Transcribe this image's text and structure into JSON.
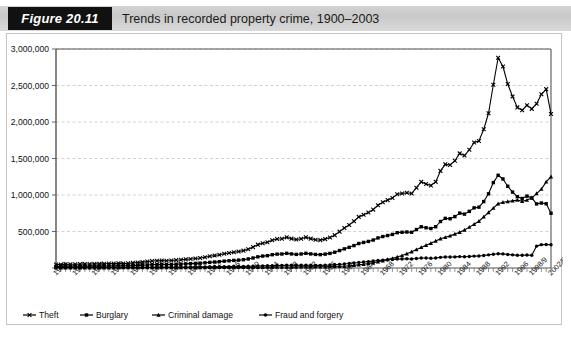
{
  "figure": {
    "tag": "Figure 20.11",
    "caption": "Trends in recorded property crime, 1900–2003"
  },
  "chart_data": {
    "type": "line",
    "title": "Trends in recorded property crime, 1900–2003",
    "xlabel": "",
    "ylabel": "",
    "ylim": [
      0,
      3000000
    ],
    "ytick_values": [
      0,
      500000,
      1000000,
      1500000,
      2000000,
      2500000,
      3000000
    ],
    "ytick_labels": [
      "",
      "500,000",
      "1,000,000",
      "1,500,000",
      "2,000,000",
      "2,500,000",
      "3,000,000"
    ],
    "grid": true,
    "grid_axis": "y",
    "legend_position": "below-axis-left",
    "x_tick_labels": [
      "1900",
      "1904",
      "1908",
      "1912",
      "1916",
      "1920",
      "1924",
      "1928",
      "1932",
      "1936",
      "1940",
      "1944",
      "1948",
      "1952",
      "1956",
      "1960",
      "1964",
      "1968",
      "1972",
      "1976",
      "1980",
      "1984",
      "1988",
      "1992",
      "1996",
      "1998/9",
      "2002/03"
    ],
    "x_tick_label_rotation": 45,
    "x_label_interval_years": 4,
    "x_start_year": 1900,
    "x_end_year": 2003,
    "x_points_count": 104,
    "series": [
      {
        "name": "Theft",
        "marker": "x",
        "color": "#000000",
        "values": [
          48000,
          49000,
          50000,
          51000,
          52000,
          53000,
          54000,
          55000,
          56000,
          57000,
          58000,
          60000,
          62000,
          64000,
          62000,
          64000,
          70000,
          76000,
          80000,
          88000,
          95000,
          100000,
          102000,
          100000,
          102000,
          108000,
          112000,
          118000,
          124000,
          130000,
          138000,
          148000,
          160000,
          172000,
          182000,
          196000,
          206000,
          216000,
          226000,
          238000,
          258000,
          286000,
          320000,
          340000,
          352000,
          380000,
          398000,
          400000,
          420000,
          402000,
          390000,
          400000,
          420000,
          402000,
          388000,
          382000,
          396000,
          418000,
          450000,
          498000,
          548000,
          590000,
          640000,
          700000,
          730000,
          760000,
          800000,
          860000,
          900000,
          930000,
          960000,
          1010000,
          1020000,
          1030000,
          1020000,
          1100000,
          1180000,
          1150000,
          1130000,
          1180000,
          1330000,
          1420000,
          1410000,
          1470000,
          1570000,
          1540000,
          1620000,
          1720000,
          1740000,
          1900000,
          2120000,
          2510000,
          2880000,
          2760000,
          2520000,
          2350000,
          2200000,
          2160000,
          2230000,
          2180000,
          2250000,
          2380000,
          2450000,
          2110000
        ]
      },
      {
        "name": "Burglary",
        "marker": "square",
        "color": "#000000",
        "values": [
          22000,
          22000,
          23000,
          23000,
          24000,
          24000,
          25000,
          25000,
          26000,
          26000,
          27000,
          28000,
          29000,
          30000,
          29000,
          30000,
          33000,
          36000,
          38000,
          42000,
          46000,
          48000,
          49000,
          48000,
          49000,
          52000,
          54000,
          57000,
          60000,
          63000,
          66000,
          71000,
          77000,
          82000,
          87000,
          94000,
          99000,
          104000,
          108000,
          114000,
          124000,
          137000,
          153000,
          163000,
          169000,
          182000,
          190000,
          192000,
          201000,
          193000,
          187000,
          192000,
          201000,
          193000,
          186000,
          183000,
          190000,
          200000,
          216000,
          239000,
          262000,
          283000,
          307000,
          335000,
          350000,
          364000,
          383000,
          412000,
          431000,
          445000,
          460000,
          484000,
          489000,
          493000,
          489000,
          527000,
          565000,
          551000,
          541000,
          565000,
          637000,
          680000,
          675000,
          704000,
          752000,
          738000,
          776000,
          824000,
          833000,
          910000,
          1016000,
          1170000,
          1270000,
          1220000,
          1120000,
          1040000,
          977000,
          952000,
          985000,
          960000,
          878000,
          890000,
          880000,
          750000
        ]
      },
      {
        "name": "Criminal damage",
        "marker": "triangle",
        "color": "#000000",
        "values": [
          4000,
          4000,
          4000,
          4000,
          4000,
          4000,
          4000,
          4000,
          4000,
          4000,
          4000,
          4000,
          4000,
          5000,
          5000,
          5000,
          5000,
          5000,
          5000,
          6000,
          6000,
          6000,
          6000,
          6000,
          6000,
          6000,
          6000,
          7000,
          7000,
          7000,
          7000,
          7000,
          8000,
          8000,
          8000,
          8000,
          9000,
          9000,
          9000,
          9000,
          10000,
          10000,
          11000,
          11000,
          12000,
          12000,
          13000,
          13000,
          14000,
          14000,
          14000,
          15000,
          15000,
          16000,
          16000,
          17000,
          18000,
          19000,
          21000,
          23000,
          25000,
          30000,
          36000,
          44000,
          52000,
          62000,
          72000,
          86000,
          100000,
          116000,
          132000,
          150000,
          170000,
          196000,
          222000,
          252000,
          282000,
          312000,
          340000,
          370000,
          400000,
          420000,
          440000,
          465000,
          490000,
          520000,
          560000,
          600000,
          640000,
          700000,
          760000,
          820000,
          880000,
          900000,
          910000,
          920000,
          930000,
          915000,
          930000,
          960000,
          1020000,
          1080000,
          1180000,
          1250000
        ]
      },
      {
        "name": "Fraud and forgery",
        "marker": "circle",
        "color": "#000000",
        "values": [
          6000,
          6000,
          6000,
          6000,
          7000,
          7000,
          7000,
          7000,
          7000,
          8000,
          8000,
          8000,
          8000,
          9000,
          9000,
          9000,
          9000,
          10000,
          10000,
          11000,
          11000,
          12000,
          12000,
          12000,
          13000,
          13000,
          13000,
          14000,
          14000,
          15000,
          15000,
          16000,
          17000,
          17000,
          18000,
          19000,
          19000,
          20000,
          21000,
          22000,
          23000,
          25000,
          27000,
          29000,
          31000,
          33000,
          35000,
          36000,
          38000,
          37000,
          36000,
          37000,
          38000,
          37000,
          36000,
          36000,
          38000,
          41000,
          45000,
          50000,
          55000,
          62000,
          68000,
          76000,
          82000,
          88000,
          95000,
          102000,
          108000,
          112000,
          116000,
          122000,
          124000,
          126000,
          124000,
          131000,
          138000,
          136000,
          134000,
          138000,
          146000,
          150000,
          150000,
          152000,
          156000,
          154000,
          158000,
          163000,
          165000,
          172000,
          180000,
          188000,
          195000,
          193000,
          185000,
          180000,
          175000,
          174000,
          178000,
          175000,
          300000,
          320000,
          322000,
          318000
        ]
      }
    ]
  },
  "legend": {
    "items": [
      {
        "label": "Theft",
        "marker": "x"
      },
      {
        "label": "Burglary",
        "marker": "square"
      },
      {
        "label": "Criminal damage",
        "marker": "triangle"
      },
      {
        "label": "Fraud and forgery",
        "marker": "circle"
      }
    ]
  },
  "colors": {
    "header_band": "#d2d2d2",
    "tag_background": "#111111",
    "tag_text": "#ffffff",
    "plot_line": "#000000",
    "gridline": "#bdbdbd",
    "axis": "#555555",
    "frame": "#c4c4c4"
  }
}
